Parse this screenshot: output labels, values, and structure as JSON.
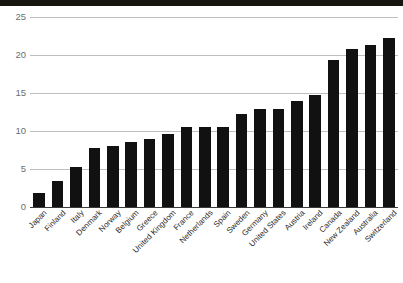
{
  "figure": {
    "background_color": "#ffffff",
    "bar_color": "#111111",
    "gridline_color": "#bfbfbf",
    "axis_color": "#3a3a3a",
    "tick_label_color": "#6d6d6d",
    "category_label_color": "#2a2a2a",
    "scan_artifact": "dark-band-top"
  },
  "chart_data": {
    "type": "bar",
    "title": "",
    "subtitle": "",
    "xlabel": "",
    "ylabel": "",
    "ylim": [
      0,
      25
    ],
    "yticks": [
      0,
      5,
      10,
      15,
      20,
      25
    ],
    "ytick_labels": [
      "0",
      "5",
      "10",
      "15",
      "20",
      "25"
    ],
    "grid": true,
    "grid_axis": "y",
    "legend": false,
    "legend_position": "none",
    "orientation": "vertical",
    "sorted": "ascending",
    "categories": [
      "Japan",
      "Finland",
      "Italy",
      "Denmark",
      "Norway",
      "Belgium",
      "Greece",
      "United Kingdom",
      "France",
      "Netherlands",
      "Spain",
      "Sweden",
      "Germany",
      "United States",
      "Austria",
      "Ireland",
      "Canada",
      "New Zealand",
      "Australia",
      "Switzerland"
    ],
    "values": [
      1.8,
      3.4,
      5.2,
      7.7,
      8.0,
      8.5,
      8.9,
      9.6,
      10.5,
      10.5,
      10.5,
      12.2,
      12.9,
      12.9,
      14.0,
      14.7,
      19.4,
      20.8,
      21.3,
      22.2
    ]
  }
}
